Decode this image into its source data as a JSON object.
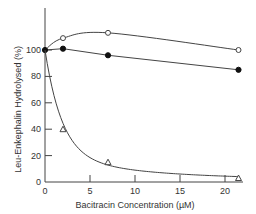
{
  "chart_data": {
    "type": "line",
    "title": "",
    "xlabel": "Bacitracin Concentration (µM)",
    "ylabel": "Leu-Enkephalin Hydrolysed (%)",
    "xlim": [
      0,
      22
    ],
    "ylim": [
      0,
      120
    ],
    "x_ticks": [
      0,
      5,
      10,
      15,
      20
    ],
    "y_ticks": [
      0,
      20,
      40,
      60,
      80,
      100
    ],
    "grid": false,
    "legend": null,
    "series": [
      {
        "name": "open-circle",
        "marker": "open-circle",
        "x": [
          0,
          2,
          7,
          21.5
        ],
        "values": [
          100,
          109,
          113,
          100
        ]
      },
      {
        "name": "filled-circle",
        "marker": "filled-circle",
        "x": [
          0,
          2,
          7,
          21.5
        ],
        "values": [
          100,
          101,
          96,
          85
        ]
      },
      {
        "name": "open-triangle",
        "marker": "open-triangle",
        "x": [
          0,
          2,
          7,
          21.5
        ],
        "values": [
          100,
          40,
          15,
          3
        ]
      }
    ]
  }
}
